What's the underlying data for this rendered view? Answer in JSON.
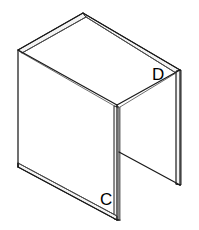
{
  "figure": {
    "type": "technical-line-drawing",
    "background_color": "#ffffff",
    "stroke_color": "#1a1a1a",
    "thin_stroke_color": "#555555",
    "panel_fill_color": "#ffffff",
    "thickness_band_color": "#f4f4f4",
    "canvas": {
      "width": 199,
      "height": 230
    },
    "labels": [
      {
        "id": "label-c",
        "text": "C",
        "x": 100,
        "y": 205,
        "describes": "front-bottom-vertical-edge"
      },
      {
        "id": "label-d",
        "text": "D",
        "x": 152,
        "y": 80,
        "describes": "right-rear-top-edge"
      }
    ],
    "vertices": {
      "top_apex": [
        83,
        13
      ],
      "top_left": [
        18,
        50
      ],
      "top_right": [
        180,
        70
      ],
      "top_front": [
        117,
        105
      ],
      "left_bottom": [
        18,
        167
      ],
      "front_bottom": [
        117,
        220
      ],
      "right_bottom": [
        180,
        185
      ],
      "inner_shelf_left": [
        119,
        152
      ],
      "inner_shelf_right": [
        180,
        185
      ]
    }
  }
}
